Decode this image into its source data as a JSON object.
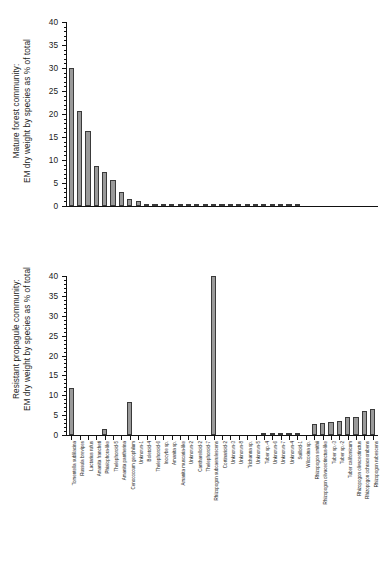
{
  "figure": {
    "background": "#ffffff",
    "bar_fill": "#9a9a9a",
    "bar_stroke": "#3a3a3a",
    "axis_color": "#111111"
  },
  "categories": [
    "Tomentella sublilacina",
    "Russula brevipes",
    "Lactarius rufus",
    "Amanita francheti",
    "Phialophora-like",
    "Thelephoroid-5",
    "Amanita pantherina",
    "Cenococcum geophilum",
    "Unknown-1",
    "Boletoid-4",
    "Thelephoroid-6",
    "Inocybe sp.",
    "Amanita sp.",
    "Amanita muscaria-like",
    "Unknown-2",
    "Cantharelloid-2",
    "Thelephoroid-7",
    "Rhizopogon subcaerulescens",
    "Cortinarioid-2",
    "Unknown-3",
    "Unknown-8",
    "Trichanna sp.",
    "Unknown-5",
    "Tuber sp.-4",
    "Unknown-6",
    "Unknown-7",
    "Unknown-4",
    "Suilloid-1",
    "Wilcoxina sp.",
    "Rhizopogon smithii",
    "Rhizopogon olivaceotinctus-like",
    "Tuber sp.-3",
    "Tuber sp.-2",
    "Tuber californicum",
    "Rhizopogon olivaceotinctus",
    "Rhizopogon ochraceorubens",
    "Rhizopogon rubescens"
  ],
  "chart_data": [
    {
      "type": "bar",
      "panel": "top",
      "title": "",
      "ylabel": "Mature forest community: EM dry weight by species as % of total",
      "ylabel_line1": "Mature forest community:",
      "ylabel_line2": "EM dry weight by species as % of total",
      "xlabel": "",
      "ylim": [
        0,
        40
      ],
      "yticks": [
        0,
        5,
        10,
        15,
        20,
        25,
        30,
        35,
        40
      ],
      "ytick_labels": [
        "0",
        "5",
        "10",
        "15",
        "20",
        "25",
        "30",
        "35",
        "40"
      ],
      "minor_tick_step": 1,
      "grid": false,
      "legend": "none",
      "categories": [
        "Tomentella sublilacina",
        "Russula brevipes",
        "Lactarius rufus",
        "Amanita francheti",
        "Phialophora-like",
        "Thelephoroid-5",
        "Amanita pantherina",
        "Cenococcum geophilum",
        "Unknown-1",
        "Boletoid-4",
        "Thelephoroid-6",
        "Inocybe sp.",
        "Amanita sp.",
        "Amanita muscaria-like",
        "Unknown-2",
        "Cantharelloid-2",
        "Thelephoroid-7",
        "Rhizopogon subcaerulescens",
        "Cortinarioid-2",
        "Unknown-3",
        "Unknown-8",
        "Trichanna sp.",
        "Unknown-5",
        "Tuber sp.-4",
        "Unknown-6",
        "Unknown-7",
        "Unknown-4",
        "Suilloid-1",
        "Wilcoxina sp.",
        "Rhizopogon smithii",
        "Rhizopogon olivaceotinctus-like",
        "Tuber sp.-3",
        "Tuber sp.-2",
        "Tuber californicum",
        "Rhizopogon olivaceotinctus",
        "Rhizopogon ochraceorubens",
        "Rhizopogon rubescens"
      ],
      "values": [
        30.0,
        20.7,
        16.2,
        8.6,
        7.4,
        5.7,
        3.0,
        1.6,
        1.0,
        0.45,
        0.4,
        0.4,
        0.35,
        0.35,
        0.3,
        0.3,
        0.3,
        0.3,
        0.25,
        0.25,
        0.25,
        0.2,
        0.2,
        0.2,
        0.2,
        0.2,
        0.2,
        0.2,
        0,
        0,
        0,
        0,
        0,
        0,
        0,
        0,
        0
      ]
    },
    {
      "type": "bar",
      "panel": "bottom",
      "title": "",
      "ylabel": "Resistant propagule community: EM dry weight by species as % of total",
      "ylabel_line1": "Resistant propagule community:",
      "ylabel_line2": "EM dry weight by species as % of total",
      "xlabel": "",
      "ylim": [
        0,
        40
      ],
      "yticks": [
        0,
        5,
        10,
        15,
        20,
        25,
        30,
        35,
        40
      ],
      "ytick_labels": [
        "0",
        "5",
        "10",
        "15",
        "20",
        "25",
        "30",
        "35",
        "40"
      ],
      "minor_tick_step": 1,
      "grid": false,
      "legend": "none",
      "categories": [
        "Tomentella sublilacina",
        "Russula brevipes",
        "Lactarius rufus",
        "Amanita francheti",
        "Phialophora-like",
        "Thelephoroid-5",
        "Amanita pantherina",
        "Cenococcum geophilum",
        "Unknown-1",
        "Boletoid-4",
        "Thelephoroid-6",
        "Inocybe sp.",
        "Amanita sp.",
        "Amanita muscaria-like",
        "Unknown-2",
        "Cantharelloid-2",
        "Thelephoroid-7",
        "Rhizopogon subcaerulescens",
        "Cortinarioid-2",
        "Unknown-3",
        "Unknown-8",
        "Trichanna sp.",
        "Unknown-5",
        "Tuber sp.-4",
        "Unknown-6",
        "Unknown-7",
        "Unknown-4",
        "Suilloid-1",
        "Wilcoxina sp.",
        "Rhizopogon smithii",
        "Rhizopogon olivaceotinctus-like",
        "Tuber sp.-3",
        "Tuber sp.-2",
        "Tuber californicum",
        "Rhizopogon olivaceotinctus",
        "Rhizopogon ochraceorubens",
        "Rhizopogon rubescens"
      ],
      "values": [
        11.8,
        0,
        0,
        0,
        1.4,
        0,
        0,
        8.2,
        0,
        0,
        0,
        0,
        0,
        0,
        0,
        0,
        0,
        40.0,
        0,
        0,
        0,
        0,
        0,
        0.35,
        0.4,
        0.45,
        0.5,
        0.55,
        0,
        2.8,
        3.0,
        3.2,
        3.6,
        4.5,
        4.5,
        6.1,
        6.6
      ]
    }
  ]
}
